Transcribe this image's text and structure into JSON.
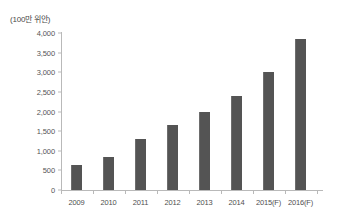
{
  "chart_data": {
    "type": "bar",
    "title": "",
    "subtitle": "",
    "unit_label": "(100만 위안)",
    "xlabel": "",
    "ylabel": "",
    "categories": [
      "2009",
      "2010",
      "2011",
      "2012",
      "2013",
      "2014",
      "2015(F)",
      "2016(F)"
    ],
    "values": [
      650,
      850,
      1300,
      1650,
      2000,
      2400,
      3000,
      3850
    ],
    "ylim": [
      0,
      4000
    ],
    "yticks": [
      0,
      500,
      1000,
      1500,
      2000,
      2500,
      3000,
      3500,
      4000
    ],
    "ytick_labels": [
      "0",
      "500",
      "1,000",
      "1,500",
      "2,000",
      "2,500",
      "3,000",
      "3,500",
      "4,000"
    ],
    "grid": false,
    "legend": null,
    "series": [
      {
        "name": "",
        "color": "#545454",
        "values": [
          650,
          850,
          1300,
          1650,
          2000,
          2400,
          3000,
          3850
        ]
      }
    ],
    "annotations": [],
    "colors": {
      "bar": "#545454",
      "bar_edge": "#6d6d6d",
      "axis": "#b9b9b9",
      "tick_text": "#4f4f4f",
      "background": "#ffffff"
    }
  }
}
